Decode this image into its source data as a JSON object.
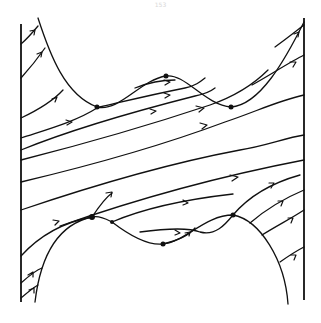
{
  "page": {
    "number": "153"
  },
  "diagram": {
    "type": "phase-portrait",
    "colors": {
      "stroke": "#111111",
      "background": "#ffffff"
    },
    "fixed_points": [
      {
        "id": "top-left-saddle",
        "x": 97,
        "y": 107
      },
      {
        "id": "top-peak",
        "x": 166,
        "y": 76
      },
      {
        "id": "top-right-saddle",
        "x": 231,
        "y": 107
      },
      {
        "id": "bottom-left-saddle",
        "x": 92,
        "y": 217
      },
      {
        "id": "bottom-mid",
        "x": 112,
        "y": 222
      },
      {
        "id": "bottom-trough",
        "x": 163,
        "y": 244
      },
      {
        "id": "bottom-right-saddle",
        "x": 233,
        "y": 215
      }
    ]
  }
}
